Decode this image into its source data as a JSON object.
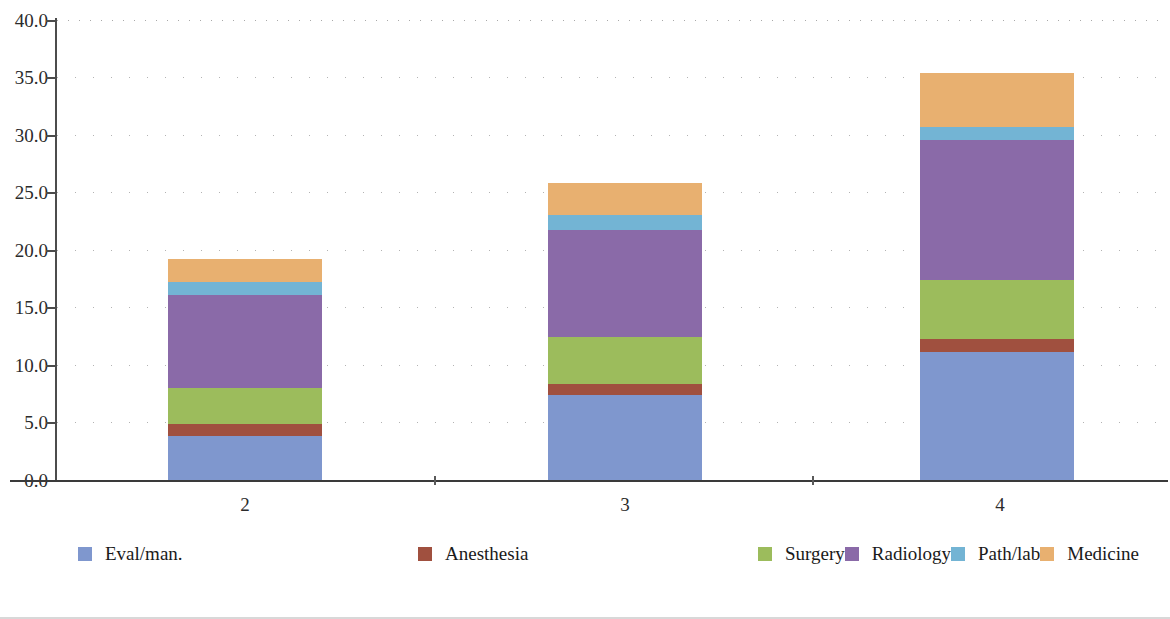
{
  "chart_data": {
    "type": "bar",
    "subtype": "stacked-bar",
    "title": "",
    "xlabel": "",
    "ylabel": "",
    "categories": [
      "2",
      "3",
      "4"
    ],
    "ylim": [
      0.0,
      40.0
    ],
    "y_ticks": [
      "0.0",
      "5.0",
      "10.0",
      "15.0",
      "20.0",
      "25.0",
      "30.0",
      "35.0",
      "40.0"
    ],
    "y_tick_values": [
      0.0,
      5.0,
      10.0,
      15.0,
      20.0,
      25.0,
      30.0,
      35.0,
      40.0
    ],
    "grid": "horizontal-dotted",
    "legend_position": "bottom-left",
    "series": [
      {
        "name": "Eval/man.",
        "color": "#7f97ce",
        "values": [
          3.85,
          7.4,
          11.1
        ]
      },
      {
        "name": "Anesthesia",
        "color": "#a0503f",
        "values": [
          1.0,
          0.95,
          1.2
        ]
      },
      {
        "name": "Surgery",
        "color": "#9cbc5c",
        "values": [
          3.15,
          4.1,
          5.1
        ]
      },
      {
        "name": "Radiology",
        "color": "#8a6aa8",
        "values": [
          8.1,
          9.3,
          12.2
        ]
      },
      {
        "name": "Path/lab",
        "color": "#73b4d4",
        "values": [
          1.1,
          1.3,
          1.1
        ]
      },
      {
        "name": "Medicine",
        "color": "#e8b070",
        "values": [
          2.0,
          2.75,
          4.7
        ]
      }
    ],
    "totals": [
      19.2,
      25.8,
      35.4
    ]
  },
  "legend": {
    "items": [
      {
        "label": "Eval/man.",
        "color": "#7f97ce"
      },
      {
        "label": "Anesthesia",
        "color": "#a0503f"
      },
      {
        "label": "Surgery",
        "color": "#9cbc5c"
      },
      {
        "label": "Radiology",
        "color": "#8a6aa8"
      },
      {
        "label": "Path/lab",
        "color": "#73b4d4"
      },
      {
        "label": "Medicine",
        "color": "#e8b070"
      }
    ]
  },
  "axes": {
    "y_labels": [
      "40.0",
      "35.0",
      "30.0",
      "25.0",
      "20.0",
      "15.0",
      "10.0",
      "5.0",
      "0.0"
    ],
    "x_labels": [
      "2",
      "3",
      "4"
    ]
  }
}
